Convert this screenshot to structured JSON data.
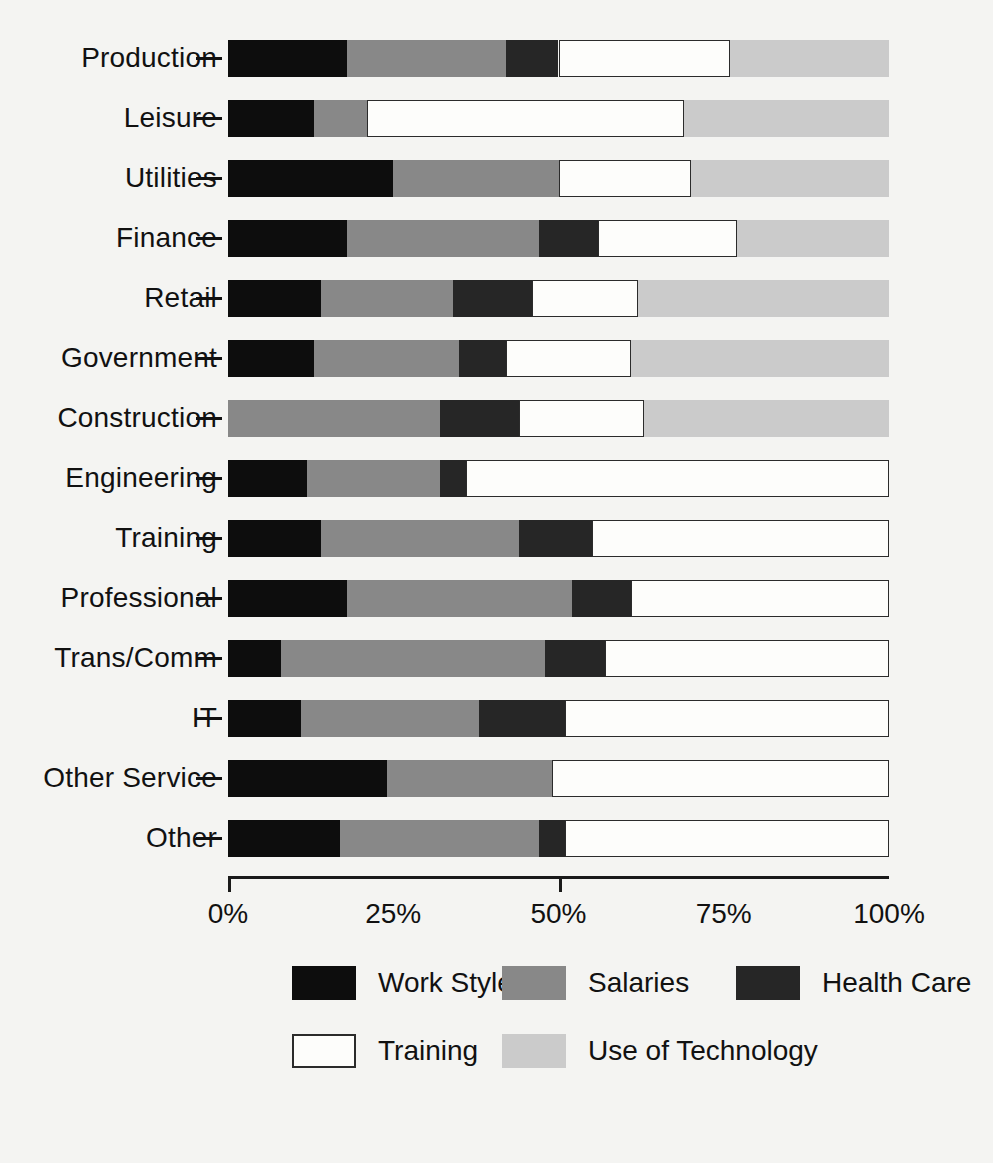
{
  "chart_data": {
    "type": "bar",
    "orientation": "horizontal",
    "stacked": true,
    "normalized": true,
    "title": "",
    "subtitle": "",
    "xlabel": "",
    "ylabel": "",
    "xlim": [
      0,
      100
    ],
    "grid": false,
    "legend_position": "bottom",
    "axis_tick_labels": [
      "0%",
      "25%",
      "50%",
      "75%",
      "100%"
    ],
    "axis_tick_values": [
      0,
      25,
      50,
      75,
      100
    ],
    "categories": [
      "Production",
      "Leisure",
      "Utilities",
      "Finance",
      "Retail",
      "Government",
      "Construction",
      "Engineering",
      "Training",
      "Professional",
      "Trans/Comm",
      "IT",
      "Other Service",
      "Other"
    ],
    "series": [
      {
        "name": "Work Styles",
        "color": "#0d0d0d",
        "values": [
          18,
          13,
          25,
          18,
          14,
          13,
          0,
          12,
          14,
          18,
          8,
          11,
          24,
          17
        ]
      },
      {
        "name": "Salaries",
        "color": "#888888",
        "values": [
          24,
          8,
          25,
          29,
          20,
          22,
          32,
          20,
          30,
          34,
          40,
          27,
          25,
          30
        ]
      },
      {
        "name": "Health Care",
        "color": "#262626",
        "values": [
          8,
          0,
          0,
          9,
          12,
          7,
          12,
          4,
          11,
          9,
          9,
          13,
          0,
          4
        ]
      },
      {
        "name": "Training",
        "color": "#fdfdfb",
        "values": [
          26,
          48,
          20,
          21,
          16,
          19,
          19,
          64,
          45,
          39,
          43,
          49,
          51,
          49
        ]
      },
      {
        "name": "Use of Technology",
        "color": "#cbcbcb",
        "values": [
          24,
          31,
          30,
          23,
          38,
          39,
          37,
          0,
          0,
          0,
          0,
          0,
          0,
          0
        ]
      }
    ]
  },
  "legend": {
    "rows": [
      [
        "Work Styles",
        "Salaries",
        "Health Care"
      ],
      [
        "Training",
        "Use of Technology"
      ]
    ]
  }
}
